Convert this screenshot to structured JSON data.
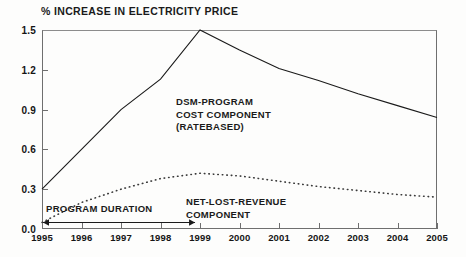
{
  "chart_data": {
    "type": "line",
    "title": "% INCREASE IN ELECTRICITY PRICE",
    "xlabel": "",
    "ylabel": "",
    "xlim": [
      1995,
      2005
    ],
    "ylim": [
      0.0,
      1.5
    ],
    "grid": false,
    "legend": "none (inline annotations)",
    "x": [
      1995,
      1996,
      1997,
      1998,
      1999,
      2000,
      2001,
      2002,
      2003,
      2004,
      2005
    ],
    "y_ticks": [
      "0.0",
      "0.3",
      "0.6",
      "0.9",
      "1.2",
      "1.5"
    ],
    "y_tick_values": [
      0.0,
      0.3,
      0.6,
      0.9,
      1.2,
      1.5
    ],
    "x_ticks": [
      "1995",
      "1996",
      "1997",
      "1998",
      "1999",
      "2000",
      "2001",
      "2002",
      "2003",
      "2004",
      "2005"
    ],
    "series": [
      {
        "name": "DSM-PROGRAM COST COMPONENT (RATEBASED)",
        "style": "solid",
        "color": "#1a1a1a",
        "values": [
          0.3,
          0.6,
          0.9,
          1.13,
          1.5,
          1.35,
          1.21,
          1.12,
          1.02,
          0.93,
          0.84
        ]
      },
      {
        "name": "NET-LOST-REVENUE COMPONENT",
        "style": "dotted",
        "color": "#3a3a3a",
        "values": [
          0.05,
          0.2,
          0.3,
          0.38,
          0.42,
          0.4,
          0.36,
          0.32,
          0.29,
          0.26,
          0.24
        ]
      }
    ],
    "annotations": [
      {
        "name": "dsm-program-cost-label",
        "lines": [
          "DSM-PROGRAM",
          "COST COMPONENT",
          "(RATEBASED)"
        ]
      },
      {
        "name": "net-lost-revenue-label",
        "lines": [
          "NET-LOST-REVENUE",
          "COMPONENT"
        ]
      },
      {
        "name": "program-duration-label",
        "text": "PROGRAM DURATION",
        "arrow_from_year": 1995,
        "arrow_to_year": 1998.9,
        "arrow_style": "double-headed"
      }
    ]
  },
  "annotations_text": {
    "dsm_line1": "DSM-PROGRAM",
    "dsm_line2": "COST COMPONENT",
    "dsm_line3": "(RATEBASED)",
    "nlr_line1": "NET-LOST-REVENUE",
    "nlr_line2": "COMPONENT",
    "duration": "PROGRAM DURATION"
  }
}
